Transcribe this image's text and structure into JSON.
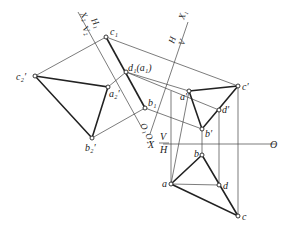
{
  "diagram": {
    "type": "orthographic-projection-auxiliary-views",
    "axes": {
      "main": {
        "label_X": "X",
        "label_V": "V",
        "label_H": "H",
        "label_O": "O"
      },
      "aux1": {
        "label_X": "X₁",
        "label_H": "H",
        "label_V": "V"
      },
      "aux2": {
        "label_X": "X₂",
        "label_H": "H₁",
        "label_V": "V₂"
      },
      "origin_marks": [
        "O₁",
        "O₂"
      ]
    },
    "points": {
      "c1": {
        "label": "c₁"
      },
      "c2p": {
        "label": "c₂′"
      },
      "a2p": {
        "label": "a₂′"
      },
      "b2p": {
        "label": "b₂′"
      },
      "d1a1": {
        "label": "d₁(a₁)"
      },
      "b1": {
        "label": "b₁"
      },
      "ap": {
        "label": "a′"
      },
      "cp": {
        "label": "c′"
      },
      "dp": {
        "label": "d′"
      },
      "bp": {
        "label": "b′"
      },
      "b": {
        "label": "b"
      },
      "a": {
        "label": "a"
      },
      "d": {
        "label": "d"
      },
      "c": {
        "label": "c"
      }
    }
  }
}
